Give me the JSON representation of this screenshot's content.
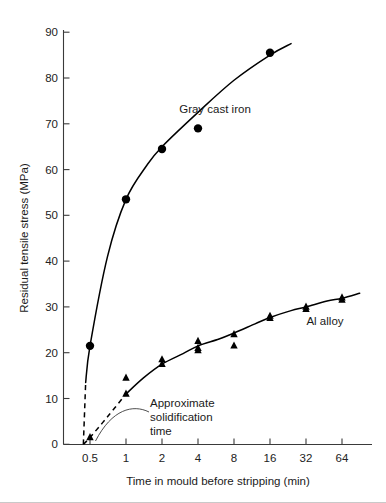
{
  "chart_data": {
    "type": "scatter",
    "title": "",
    "xlabel": "Time in mould before stripping (min)",
    "ylabel": "Residual tensile stress (MPa)",
    "xscale": "log2",
    "xlim": [
      0.35,
      100
    ],
    "ylim": [
      0,
      93
    ],
    "grid": false,
    "legend_position": "inline-annotations",
    "xticks": [
      "0.5",
      "1",
      "2",
      "4",
      "8",
      "16",
      "32",
      "64"
    ],
    "xtick_values": [
      0.5,
      1,
      2,
      4,
      8,
      16,
      32,
      64
    ],
    "yticks": [
      "0",
      "10",
      "20",
      "30",
      "40",
      "50",
      "60",
      "70",
      "80",
      "90"
    ],
    "ytick_values": [
      0,
      10,
      20,
      30,
      40,
      50,
      60,
      70,
      80,
      90
    ],
    "series": [
      {
        "name": "Gray cast iron",
        "marker": "filled-circle",
        "label": "Gray cast iron",
        "points": [
          {
            "x": 0.5,
            "y": 21.5
          },
          {
            "x": 1.0,
            "y": 53.5
          },
          {
            "x": 2.0,
            "y": 64.5
          },
          {
            "x": 4.0,
            "y": 69.0
          },
          {
            "x": 16.0,
            "y": 85.5
          }
        ],
        "fit_curve": [
          {
            "x": 0.46,
            "y": 13.5
          },
          {
            "x": 0.5,
            "y": 21.5
          },
          {
            "x": 0.7,
            "y": 41.0
          },
          {
            "x": 1.0,
            "y": 53.5
          },
          {
            "x": 1.5,
            "y": 61.0
          },
          {
            "x": 2.0,
            "y": 65.0
          },
          {
            "x": 4.0,
            "y": 72.5
          },
          {
            "x": 8.0,
            "y": 79.5
          },
          {
            "x": 16.0,
            "y": 85.0
          },
          {
            "x": 24.0,
            "y": 87.5
          }
        ],
        "extrapolation_dashed": [
          {
            "x": 0.44,
            "y": 0.0
          },
          {
            "x": 0.46,
            "y": 13.5
          }
        ]
      },
      {
        "name": "Al alloy",
        "marker": "filled-triangle",
        "label": "Al alloy",
        "points": [
          {
            "x": 0.5,
            "y": 1.5
          },
          {
            "x": 1.0,
            "y": 11.0
          },
          {
            "x": 1.0,
            "y": 14.5
          },
          {
            "x": 2.0,
            "y": 17.5
          },
          {
            "x": 2.0,
            "y": 18.5
          },
          {
            "x": 4.0,
            "y": 20.5
          },
          {
            "x": 4.0,
            "y": 21.0
          },
          {
            "x": 4.0,
            "y": 22.5
          },
          {
            "x": 8.0,
            "y": 21.5
          },
          {
            "x": 8.0,
            "y": 24.0
          },
          {
            "x": 16.0,
            "y": 27.5
          },
          {
            "x": 16.0,
            "y": 28.0
          },
          {
            "x": 32.0,
            "y": 29.5
          },
          {
            "x": 32.0,
            "y": 30.0
          },
          {
            "x": 64.0,
            "y": 31.5
          },
          {
            "x": 64.0,
            "y": 32.0
          }
        ],
        "fit_curve": [
          {
            "x": 1.0,
            "y": 11.0
          },
          {
            "x": 1.4,
            "y": 14.5
          },
          {
            "x": 2.0,
            "y": 17.5
          },
          {
            "x": 3.0,
            "y": 19.8
          },
          {
            "x": 4.0,
            "y": 21.5
          },
          {
            "x": 6.0,
            "y": 23.0
          },
          {
            "x": 8.0,
            "y": 24.3
          },
          {
            "x": 12.0,
            "y": 26.3
          },
          {
            "x": 16.0,
            "y": 27.7
          },
          {
            "x": 24.0,
            "y": 29.2
          },
          {
            "x": 32.0,
            "y": 30.0
          },
          {
            "x": 48.0,
            "y": 31.3
          },
          {
            "x": 64.0,
            "y": 31.9
          },
          {
            "x": 90.0,
            "y": 33.0
          }
        ],
        "extrapolation_dashed": [
          {
            "x": 0.44,
            "y": 0.0
          },
          {
            "x": 0.5,
            "y": 1.5
          },
          {
            "x": 0.7,
            "y": 6.0
          },
          {
            "x": 1.0,
            "y": 11.0
          }
        ]
      }
    ],
    "annotations": [
      {
        "name": "solidification-time",
        "text_lines": [
          "Approximate",
          "solidification",
          "time"
        ],
        "points_to": {
          "x": 0.46,
          "y": 0.5
        }
      }
    ],
    "colors": {
      "marker": "#000000",
      "curve": "#000000",
      "axis": "#3a3a3a",
      "text": "#1a1a1a",
      "background": "#ffffff"
    }
  }
}
